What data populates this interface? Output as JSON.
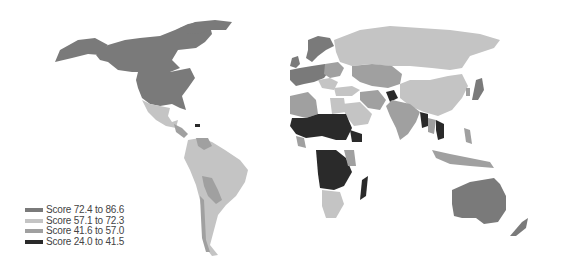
{
  "map": {
    "type": "choropleth",
    "projection": "world",
    "colors": {
      "tier1": "#7a7a7a",
      "tier2": "#c4c4c4",
      "tier3": "#a0a0a0",
      "tier4": "#2a2a2a",
      "nodata": "#ffffff",
      "border": "#ffffff"
    },
    "legend": [
      {
        "label": "Score 72.4 to 86.6",
        "color": "#7a7a7a"
      },
      {
        "label": "Score 57.1 to 72.3",
        "color": "#c4c4c4"
      },
      {
        "label": "Score 41.6 to 57.0",
        "color": "#a0a0a0"
      },
      {
        "label": "Score 24.0 to 41.5",
        "color": "#2a2a2a"
      }
    ]
  }
}
